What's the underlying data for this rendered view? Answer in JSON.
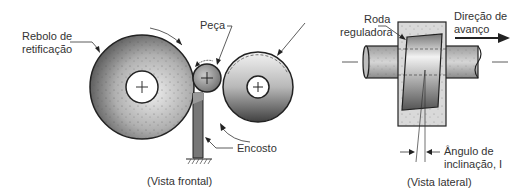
{
  "frontal_view": {
    "caption": "(Vista frontal)",
    "labels": {
      "grinding_wheel_line1": "Rebolo de",
      "grinding_wheel_line2": "retificação",
      "workpiece": "Peça",
      "rest": "Encosto"
    }
  },
  "side_view": {
    "caption": "(Vista lateral)",
    "labels": {
      "regulating_wheel_line1": "Roda",
      "regulating_wheel_line2": "reguladora",
      "feed_direction_line1": "Direção de",
      "feed_direction_line2": "avanço",
      "inclination_line1": "Ângulo de",
      "inclination_line2": "inclinação, I"
    }
  },
  "colors": {
    "outline": "#222222",
    "text": "#333333",
    "wheel_dark": "#6a6a6a",
    "wheel_light": "#e8e8e8",
    "block_fill": "#d8d8d8"
  }
}
